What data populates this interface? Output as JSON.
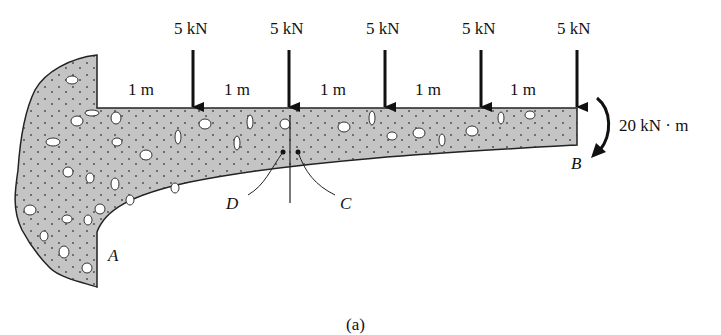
{
  "figure": {
    "caption": "(a)",
    "loads": [
      {
        "label": "5 kN",
        "x": 193
      },
      {
        "label": "5 kN",
        "x": 289
      },
      {
        "label": "5 kN",
        "x": 385
      },
      {
        "label": "5 kN",
        "x": 481
      },
      {
        "label": "5 kN",
        "x": 577
      }
    ],
    "spans": [
      "1 m",
      "1 m",
      "1 m",
      "1 m",
      "1 m"
    ],
    "moment": {
      "label": "20 kN · m"
    },
    "points": {
      "A": "A",
      "B": "B",
      "C": "C",
      "D": "D"
    },
    "colors": {
      "concrete": "#c8c8c8",
      "outline": "#222222",
      "arrow": "#111111"
    }
  }
}
